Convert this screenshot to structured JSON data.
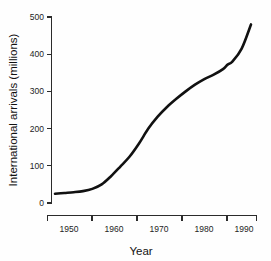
{
  "chart_data": {
    "type": "line",
    "title": "",
    "xlabel": "Year",
    "ylabel": "International arrivals (millions)",
    "xlim": [
      1947,
      1994
    ],
    "ylim": [
      0,
      500
    ],
    "grid": false,
    "legend": null,
    "x_ticks": [
      1950,
      1960,
      1970,
      1980,
      1990
    ],
    "x_tick_labels": [
      "1950",
      "1960",
      "1970",
      "1980",
      "1990"
    ],
    "y_ticks": [
      0,
      100,
      200,
      300,
      400,
      500
    ],
    "y_tick_labels": [
      "0",
      "100",
      "200",
      "300",
      "400",
      "500"
    ],
    "series": [
      {
        "name": "International arrivals",
        "color": "#111111",
        "x": [
          1950,
          1952,
          1954,
          1956,
          1958,
          1960,
          1962,
          1964,
          1966,
          1968,
          1970,
          1972,
          1974,
          1976,
          1978,
          1980,
          1982,
          1984,
          1986,
          1987,
          1988,
          1990,
          1992
        ],
        "values": [
          25,
          27,
          29,
          32,
          38,
          50,
          72,
          98,
          125,
          160,
          200,
          232,
          258,
          280,
          300,
          318,
          333,
          345,
          360,
          372,
          380,
          415,
          480
        ]
      }
    ]
  },
  "axis_titles": {
    "x": "Year",
    "y": "International arrivals (millions)"
  },
  "tick_text": {
    "y500": "500",
    "y400": "400",
    "y300": "300",
    "y200": "200",
    "y100": "100",
    "y0": "0",
    "x1950": "1950",
    "x1960": "1960",
    "x1970": "1970",
    "x1980": "1980",
    "x1990": "1990"
  },
  "colors": {
    "line": "#111111",
    "axis": "#2b2b2b",
    "text": "#1a1a1a",
    "background": "#fefefe"
  }
}
